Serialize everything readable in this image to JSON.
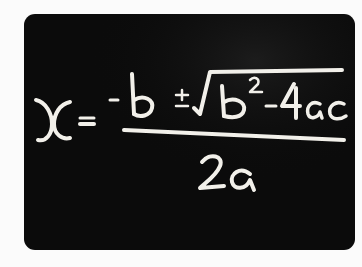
{
  "image": {
    "subject": "chalkboard",
    "description": "Quadratic formula handwritten in chalk on a blackboard",
    "formula_text": "x = (-b ± √(b² - 4ac)) / 2a",
    "numerator": "-b ± √(b² - 4ac)",
    "denominator": "2a",
    "lhs": "x",
    "colors": {
      "background": "#fbfbfb",
      "board": "#0b0b0b",
      "chalk": "#f2f0ea"
    }
  }
}
